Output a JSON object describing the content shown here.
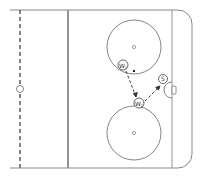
{
  "diagram": {
    "type": "hockey-rink-drill",
    "colors": {
      "line": "#777777",
      "background": "#ffffff",
      "arrow": "#333333"
    },
    "players": [
      {
        "id": "w1",
        "label": "W",
        "subscript": "1"
      },
      {
        "id": "w2",
        "label": "W",
        "subscript": "2"
      },
      {
        "id": "s",
        "label": "S",
        "subscript": ""
      }
    ]
  }
}
